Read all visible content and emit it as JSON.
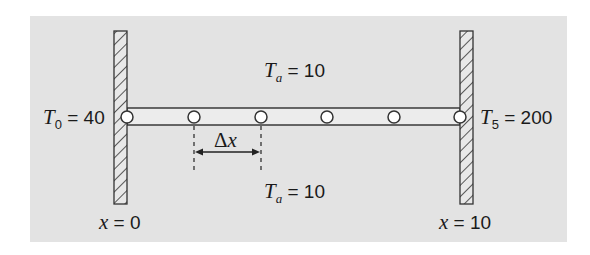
{
  "diagram": {
    "type": "heated-rod-finite-difference",
    "background_color": "#e3e3e3",
    "rod_fill_color": "#ececec",
    "line_color": "#333333",
    "nodes": [
      {
        "index": 0,
        "x": 127
      },
      {
        "index": 1,
        "x": 194
      },
      {
        "index": 2,
        "x": 261
      },
      {
        "index": 3,
        "x": 327
      },
      {
        "index": 4,
        "x": 394
      },
      {
        "index": 5,
        "x": 460
      }
    ],
    "labels": {
      "ambient_top": {
        "var": "T",
        "sub": "a",
        "eq": " = 10"
      },
      "ambient_bottom": {
        "var": "T",
        "sub": "a",
        "eq": " = 10"
      },
      "left_boundary": {
        "var": "T",
        "sub": "0",
        "eq": " = 40"
      },
      "right_boundary": {
        "var": "T",
        "sub": "5",
        "eq": " = 200"
      },
      "spacing": {
        "delta": "Δ",
        "var": "x"
      },
      "left_position": {
        "var": "x",
        "eq": " = 0"
      },
      "right_position": {
        "var": "x",
        "eq": " = 10"
      }
    }
  }
}
